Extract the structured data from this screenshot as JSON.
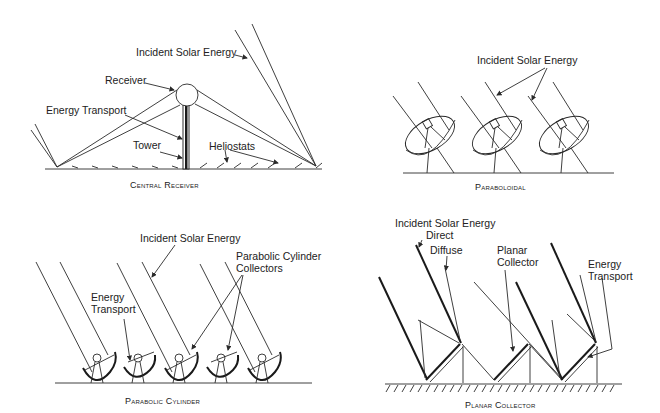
{
  "panels": {
    "central_receiver": {
      "caption": "Central Receiver",
      "labels": {
        "incident": "Incident Solar Energy",
        "receiver": "Receiver",
        "energy_transport": "Energy Transport",
        "tower": "Tower",
        "heliostats": "Heliostats"
      }
    },
    "paraboloidal": {
      "caption": "Paraboloidal",
      "labels": {
        "incident": "Incident Solar Energy"
      }
    },
    "parabolic_cylinder": {
      "caption": "Parabolic Cylinder",
      "labels": {
        "incident": "Incident Solar Energy",
        "collectors_line1": "Parabolic Cylinder",
        "collectors_line2": "Collectors",
        "transport_line1": "Energy",
        "transport_line2": "Transport"
      }
    },
    "planar_collector": {
      "caption": "Planar Collector",
      "labels": {
        "incident": "Incident Solar Energy",
        "direct": "Direct",
        "diffuse": "Diffuse",
        "planar_line1": "Planar",
        "planar_line2": "Collector",
        "transport_line1": "Energy",
        "transport_line2": "Transport"
      }
    }
  },
  "colors": {
    "line": "#2a2a2a",
    "background": "#ffffff"
  }
}
